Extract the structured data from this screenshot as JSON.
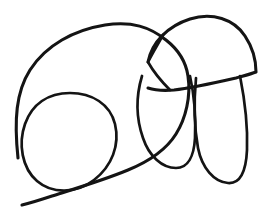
{
  "document": {
    "title": "Untitled hand-drawn sketch",
    "kind": "line-drawing",
    "subject_guess": "quadruped animal (elephant-like) contour sketch",
    "canvas": {
      "width": 273,
      "height": 218,
      "background_color": "#ffffff"
    },
    "ink": {
      "color": "#141414",
      "stroke_widths": {
        "thick": 3.1,
        "medium": 2.7,
        "thin": 2.3
      },
      "style": "freehand single-weight marker / pen outline, no shading, no fill"
    },
    "stroke_count": 6,
    "strokes": [
      {
        "id": "body-outline",
        "name": "body-outline-stroke",
        "description": "Large open contour forming the torso: rises from lower-left, arcs across the top to the right, descends through the middle, and sweeps back down-left to the bottom edge.",
        "weight": "thick",
        "path": "M 18 158 C 14 120 16 92 30 70 C 46 45 74 30 105 25 C 132 21 150 27 166 40 C 180 51 186 62 188 76 C 191 96 186 118 176 134 C 166 150 150 161 128 170 C 104 180 74 189 52 196 C 40 200 30 203 22 205"
      },
      {
        "id": "inner-circle",
        "name": "inner-circle-stroke",
        "description": "Closed rounded loop in the lower-left quadrant (shoulder / haunch), slightly egg-shaped and tilted, overlapping the body outline on its left and bottom.",
        "weight": "med",
        "path": "M 70 93 C 92 93 110 104 115 124 C 120 145 112 166 94 180 C 76 194 52 194 37 181 C 22 168 18 144 25 124 C 32 104 48 93 70 93 Z"
      },
      {
        "id": "head-dome",
        "name": "head-dome-stroke",
        "description": "Dome / arch on the upper right forming the head: starts at the ear notch, arcs up over the top and down the right side to a corner, then runs left along a flat underside.",
        "weight": "thick",
        "path": "M 148 62 C 152 42 168 26 190 19 C 212 12 234 19 245 36 C 253 48 256 62 256 72 C 251 74 243 76 236 78 C 214 83 192 88 174 90 C 162 91 154 90 148 88"
      },
      {
        "id": "ear-notch",
        "name": "ear-notch-stroke",
        "description": "Short angular V/kite shape at the left base of the dome — the ear or jaw notch, with a sharp corner pointing left at about (148,62).",
        "weight": "med",
        "path": "M 163 35 C 158 44 152 54 148 62 C 153 71 161 81 170 90"
      },
      {
        "id": "front-leg",
        "name": "front-leg-stroke",
        "description": "Long rounded loop hanging from the body centre-right: the near front leg, a narrow U that descends from about y=72 to a rounded foot near y=160 and returns upward.",
        "weight": "med",
        "path": "M 142 76 C 136 96 136 118 143 138 C 149 156 162 168 176 168 C 188 168 194 156 195 138 C 196 116 194 94 190 76"
      },
      {
        "id": "hind-leg",
        "name": "hind-leg-stroke",
        "description": "Second long rounded loop on the far right: the hind leg, descending from the dome's underside near y=72 to a rounded foot near y=185 and back up.",
        "weight": "med",
        "path": "M 196 78 C 194 100 194 126 198 148 C 202 168 214 182 228 183 C 240 184 246 172 247 150 C 248 124 244 96 240 76"
      }
    ],
    "regions": [
      {
        "name": "torso",
        "label": "large body outline, upper-left to centre"
      },
      {
        "name": "haunch-circle",
        "label": "inner circle, lower left"
      },
      {
        "name": "head",
        "label": "dome shape, upper right"
      },
      {
        "name": "ear",
        "label": "angular notch, centre right"
      },
      {
        "name": "leg-front",
        "label": "inner hanging loop"
      },
      {
        "name": "leg-hind",
        "label": "outer hanging loop, far right"
      }
    ]
  }
}
